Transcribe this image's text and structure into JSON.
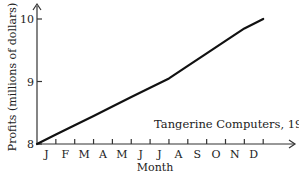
{
  "chart_data": {
    "type": "line",
    "title": "",
    "annotation": "Tangerine Computers, 1982",
    "xlabel": "Month",
    "ylabel": "Profits (millions of dollars)",
    "categories": [
      "J",
      "F",
      "M",
      "A",
      "M",
      "J",
      "J",
      "A",
      "S",
      "O",
      "N",
      "D"
    ],
    "yticks": [
      "8",
      "9",
      "10"
    ],
    "ylim": [
      8,
      10.2
    ],
    "grid": false,
    "legend": "none",
    "series": [
      {
        "name": "Profits",
        "x": [
          0,
          1,
          2,
          3,
          4,
          5,
          6,
          7,
          8,
          9,
          10,
          11,
          12
        ],
        "values": [
          8.0,
          8.15,
          8.3,
          8.45,
          8.6,
          8.75,
          8.9,
          9.05,
          9.25,
          9.45,
          9.65,
          9.85,
          10.0
        ]
      }
    ]
  }
}
